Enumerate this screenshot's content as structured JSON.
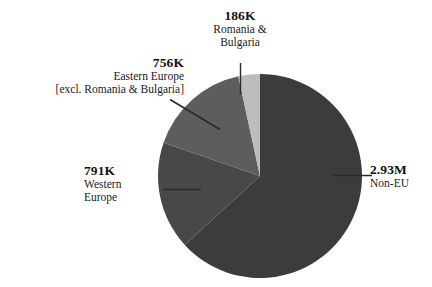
{
  "chart_data": {
    "type": "pie",
    "title": "",
    "subtitle": "",
    "xlabel": "",
    "ylabel": "",
    "legend_position": "none",
    "grid": false,
    "units": "people",
    "total_label": "",
    "categories": [
      "Non-EU",
      "Western Europe",
      "Eastern Europe [excl. Romania & Bulgaria]",
      "Romania & Bulgaria"
    ],
    "value_labels": [
      "2.93M",
      "791K",
      "756K",
      "186K"
    ],
    "values": [
      2930000,
      791000,
      756000,
      186000
    ],
    "colors": [
      "#3c3c3c",
      "#484848",
      "#5d5d5d",
      "#bdbdbd"
    ],
    "slices": [
      {
        "name": "Non-EU",
        "value_label": "2.93M",
        "value": 2930000,
        "percent": 63.2,
        "color": "#3c3c3c",
        "start_angle_deg": 0,
        "end_angle_deg": 227.5
      },
      {
        "name": "Western Europe",
        "value_label": "791K",
        "value": 791000,
        "percent": 17.1,
        "color": "#484848",
        "start_angle_deg": 227.5,
        "end_angle_deg": 289.0
      },
      {
        "name": "Eastern Europe [excl. Romania & Bulgaria]",
        "value_label": "756K",
        "value": 756000,
        "percent": 16.3,
        "color": "#5d5d5d",
        "start_angle_deg": 289.0,
        "end_angle_deg": 347.7
      },
      {
        "name": "Romania & Bulgaria",
        "value_label": "186K",
        "value": 186000,
        "percent": 4.0,
        "color": "#bdbdbd",
        "start_angle_deg": 347.7,
        "end_angle_deg": 360.0
      }
    ]
  },
  "labels": {
    "romania": {
      "value": "186K",
      "line1": "Romania &",
      "line2": "Bulgaria"
    },
    "eastern": {
      "value": "756K",
      "line1": "Eastern Europe",
      "line2": "[excl. Romania & Bulgaria]"
    },
    "western": {
      "value": "791K",
      "line1": "Western",
      "line2": "Europe"
    },
    "noneu": {
      "value": "2.93M",
      "line1": "Non-EU"
    }
  },
  "style": {
    "background": "#ffffff",
    "leader_line_color": "#2a2a2a",
    "text_color": "#1a1a1a"
  }
}
